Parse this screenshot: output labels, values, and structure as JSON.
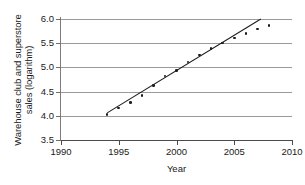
{
  "chart_data": {
    "type": "scatter",
    "title": "",
    "xlabel": "Year",
    "ylabel": "Warehouse club and superstore sales (logarithm)",
    "ylabel_line1": "Warehouse club and superstore",
    "ylabel_line2": "sales (logarithm)",
    "xlim": [
      1990,
      2010
    ],
    "ylim": [
      3.5,
      6.0
    ],
    "xticks": [
      1990,
      1995,
      2000,
      2005,
      2010
    ],
    "yticks": [
      3.5,
      4.0,
      4.5,
      5.0,
      5.5,
      6.0
    ],
    "xtick_labels": [
      "1990",
      "1995",
      "2000",
      "2005",
      "2010"
    ],
    "ytick_labels": [
      "3.5",
      "4.0",
      "4.5",
      "5.0",
      "5.5",
      "6.0"
    ],
    "grid": "horizontal",
    "legend": "none",
    "x": [
      1994,
      1995,
      1996,
      1997,
      1998,
      1999,
      2000,
      2001,
      2002,
      2003,
      2004,
      2005,
      2006,
      2007,
      2008
    ],
    "values": [
      4.03,
      4.16,
      4.27,
      4.42,
      4.63,
      4.82,
      4.94,
      5.11,
      5.26,
      5.39,
      5.5,
      5.61,
      5.7,
      5.79,
      5.87
    ],
    "series": [
      {
        "name": "Warehouse club and superstore sales (logarithm)",
        "marker": "filled-circle",
        "color": "#1c1c1c",
        "values": [
          4.03,
          4.16,
          4.27,
          4.42,
          4.63,
          4.82,
          4.94,
          5.11,
          5.26,
          5.39,
          5.5,
          5.61,
          5.7,
          5.79,
          5.87
        ]
      }
    ],
    "trendline": {
      "type": "linear-fit",
      "color": "#1c1c1c",
      "x_start": 1994,
      "x_end": 2007.3,
      "y_start": 4.06,
      "y_end": 6.0
    }
  },
  "axis": {
    "y_title_line1": "Warehouse club and superstore",
    "y_title_line2": "sales (logarithm)",
    "x_title": "Year"
  }
}
